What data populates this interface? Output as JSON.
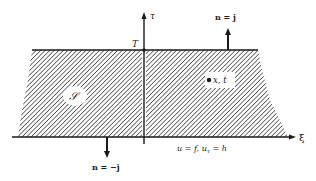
{
  "diagram": {
    "type": "domain-of-dependence",
    "axes": {
      "horizontal_label": "ξ",
      "vertical_label": "τ"
    },
    "labels": {
      "top_intercept": "T",
      "region": "𝒮",
      "point": "x, t",
      "top_normal": "n = j",
      "bottom_normal": "n = −j",
      "boundary_condition": "u = f, u",
      "boundary_condition_sub": "τ",
      "boundary_condition_tail": " = h"
    },
    "colors": {
      "ink": "#1a1a1a",
      "hatch": "#3a3a3a",
      "background": "#ffffff"
    }
  }
}
